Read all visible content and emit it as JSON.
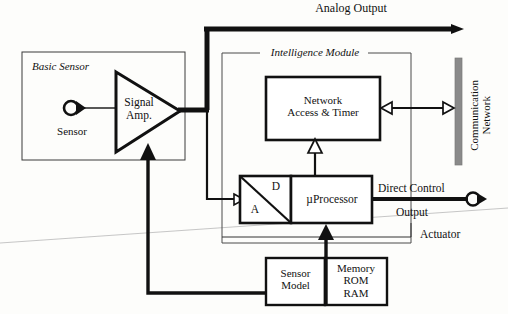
{
  "figure": {
    "type": "block-diagram"
  },
  "labels": {
    "analog_output": "Analog Output",
    "basic_sensor": "Basic Sensor",
    "sensor": "Sensor",
    "signal_amp": "Signal\nAmp.",
    "intelligence_module": "Intelligence Module",
    "network_access_timer": "Network\nAccess & Timer",
    "communication_network": "Communication\nNetwork",
    "converter_d": "D",
    "converter_a": "A",
    "microprocessor": "µProcessor",
    "direct_control": "Direct Control",
    "output": "Output",
    "actuator": "Actuator",
    "sensor_model": "Sensor\nModel",
    "memory": "Memory\nROM\nRAM"
  },
  "blocks": [
    {
      "name": "basic-sensor-enclosure",
      "label": "Basic Sensor",
      "x": 22,
      "y": 52,
      "w": 163,
      "h": 108,
      "style": "thin-rect"
    },
    {
      "name": "intelligence-module-enclosure",
      "label": "Intelligence Module",
      "x": 222,
      "y": 53,
      "w": 189,
      "h": 190,
      "style": "thin-rect-gapped"
    },
    {
      "name": "signal-amplifier",
      "label": "Signal Amp.",
      "shape": "triangle",
      "x": 116,
      "y": 72,
      "w": 64,
      "h": 80
    },
    {
      "name": "network-access-timer-block",
      "label": "Network Access & Timer",
      "x": 266,
      "y": 77,
      "w": 114,
      "h": 63,
      "style": "thick-rect"
    },
    {
      "name": "ad-converter-block",
      "label": "A / D",
      "x": 240,
      "y": 176,
      "w": 51,
      "h": 47,
      "style": "thick-rect"
    },
    {
      "name": "microprocessor-block",
      "label": "µProcessor",
      "x": 291,
      "y": 176,
      "w": 81,
      "h": 47,
      "style": "thick-rect"
    },
    {
      "name": "sensor-model-block",
      "label": "Sensor Model",
      "x": 266,
      "y": 258,
      "w": 59,
      "h": 47,
      "style": "thick-rect"
    },
    {
      "name": "memory-block",
      "label": "Memory ROM RAM",
      "x": 325,
      "y": 258,
      "w": 62,
      "h": 47,
      "style": "thick-rect"
    },
    {
      "name": "communication-network-bus",
      "label": "Communication Network",
      "x": 455,
      "y": 58,
      "w": 7,
      "h": 107,
      "style": "gray-bar"
    }
  ],
  "connectors": [
    {
      "name": "sensor-to-amplifier-line",
      "kind": "thin",
      "from": "sensor-symbol",
      "to": "signal-amplifier"
    },
    {
      "name": "amplifier-to-analog-output-bus",
      "kind": "thick",
      "from": "signal-amplifier",
      "to": "analog-output-arrow"
    },
    {
      "name": "analog-output-arrow",
      "kind": "thick-arrow",
      "direction": "right"
    },
    {
      "name": "amplifier-to-ad-converter-line",
      "kind": "medium",
      "from": "signal-amplifier",
      "to": "ad-converter-block",
      "arrow": "hollow"
    },
    {
      "name": "network-block-to-bus-link",
      "kind": "medium-double",
      "from": "network-access-timer-block",
      "to": "communication-network-bus",
      "arrow": "hollow-both"
    },
    {
      "name": "microprocessor-to-network-block-link",
      "kind": "medium",
      "from": "microprocessor-block",
      "to": "network-access-timer-block",
      "arrow": "hollow-up"
    },
    {
      "name": "memory-to-microprocessor-link",
      "kind": "thick",
      "from": "memory-block",
      "to": "microprocessor-block",
      "arrow": "solid-up"
    },
    {
      "name": "microprocessor-feedback-loop",
      "kind": "thin",
      "from": "microprocessor-block",
      "to": "microprocessor-block"
    },
    {
      "name": "sensor-model-to-amplifier-feedback",
      "kind": "thick",
      "from": "sensor-model-block",
      "to": "signal-amplifier",
      "arrow": "solid-up"
    },
    {
      "name": "microprocessor-to-actuator-line",
      "kind": "thick",
      "from": "microprocessor-block",
      "to": "actuator-symbol"
    }
  ],
  "colors": {
    "stroke": "#111111",
    "bus_gray": "#8a8a8a",
    "background": "#fdfdfb",
    "artifact_line": "#b9b9b9"
  }
}
